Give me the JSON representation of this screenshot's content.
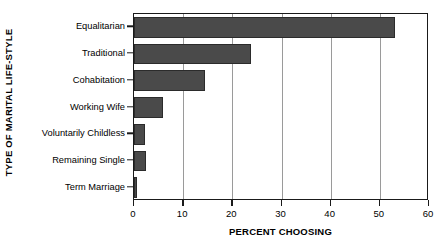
{
  "chart_data": {
    "type": "bar",
    "orientation": "horizontal",
    "title": "",
    "xlabel": "PERCENT CHOOSING",
    "ylabel": "TYPE OF MARITAL LIFE-STYLE",
    "categories": [
      "Equalitarian",
      "Traditional",
      "Cohabitation",
      "Working Wife",
      "Voluntarily Childless",
      "Remaining Single",
      "Term Marriage"
    ],
    "values": [
      53,
      23.8,
      14.4,
      5.9,
      2.2,
      2.4,
      0.7
    ],
    "xlim": [
      0,
      60
    ],
    "xticks": [
      0,
      10,
      20,
      30,
      40,
      50,
      60
    ],
    "xticklabels": [
      "0",
      "10",
      "20",
      "30",
      "40",
      "50",
      "60"
    ],
    "grid": "vertical",
    "legend": "none",
    "bar_color": "#4a4a4a",
    "bar_edge_color": "#2b2b2b",
    "gridline_color": "#9a9a9a",
    "axis_color": "#1a1a1a",
    "background_color": "#ffffff"
  }
}
